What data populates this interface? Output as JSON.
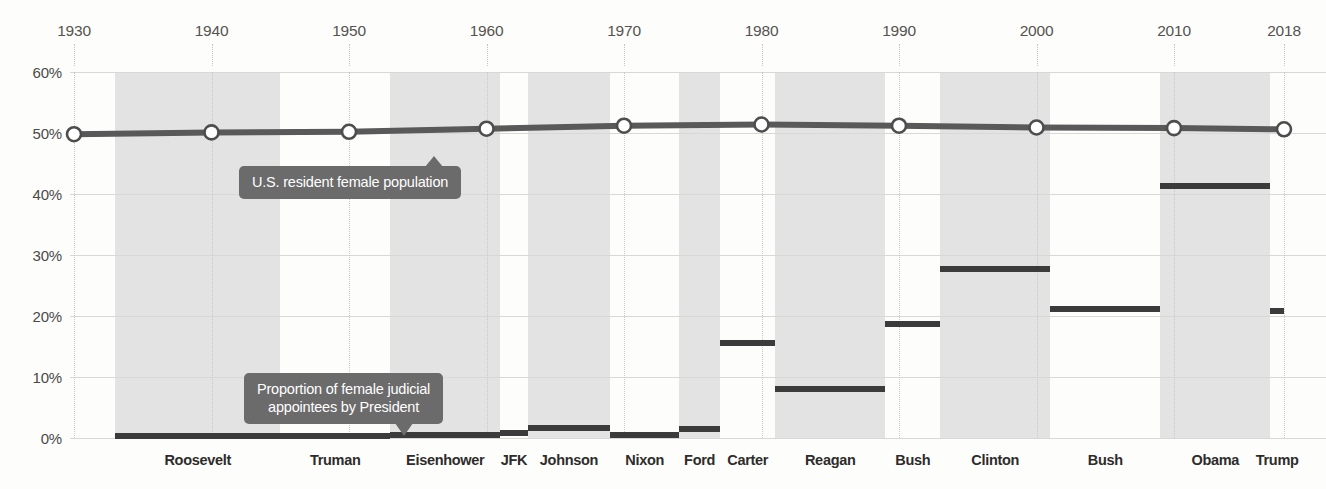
{
  "chart_data": {
    "type": "bar",
    "title": "",
    "subtitle": "",
    "xlabel": "",
    "ylabel": "",
    "ylim": [
      0,
      60
    ],
    "y_ticks": [
      "0%",
      "10%",
      "20%",
      "30%",
      "40%",
      "50%",
      "60%"
    ],
    "y_tick_values": [
      0,
      10,
      20,
      30,
      40,
      50,
      60
    ],
    "x_ticks": [
      "1930",
      "1940",
      "1950",
      "1960",
      "1970",
      "1980",
      "1990",
      "2000",
      "2010",
      "2018"
    ],
    "x_tick_values": [
      1930,
      1940,
      1950,
      1960,
      1970,
      1980,
      1990,
      2000,
      2010,
      2018
    ],
    "grid": true,
    "legend_position": "annotations",
    "categories": [
      "Roosevelt",
      "Truman",
      "Eisenhower",
      "JFK",
      "Johnson",
      "Nixon",
      "Ford",
      "Carter",
      "Reagan",
      "Bush",
      "Clinton",
      "Bush",
      "Obama",
      "Trump"
    ],
    "series": [
      {
        "name": "Proportion of female judicial appointees by President",
        "type": "step",
        "color": "#3b3b3b",
        "values": [
          0.4,
          0.4,
          0.5,
          0.8,
          1.7,
          0.5,
          1.5,
          15.5,
          8.0,
          18.7,
          27.7,
          21.2,
          41.3,
          20.8
        ],
        "terms": [
          {
            "president": "Roosevelt",
            "start": 1933,
            "end": 1945,
            "value": 0.4
          },
          {
            "president": "Truman",
            "start": 1945,
            "end": 1953,
            "value": 0.4
          },
          {
            "president": "Eisenhower",
            "start": 1953,
            "end": 1961,
            "value": 0.5
          },
          {
            "president": "JFK",
            "start": 1961,
            "end": 1963,
            "value": 0.8
          },
          {
            "president": "Johnson",
            "start": 1963,
            "end": 1969,
            "value": 1.7
          },
          {
            "president": "Nixon",
            "start": 1969,
            "end": 1974,
            "value": 0.5
          },
          {
            "president": "Ford",
            "start": 1974,
            "end": 1977,
            "value": 1.5
          },
          {
            "president": "Carter",
            "start": 1977,
            "end": 1981,
            "value": 15.5
          },
          {
            "president": "Reagan",
            "start": 1981,
            "end": 1989,
            "value": 8.0
          },
          {
            "president": "Bush",
            "start": 1989,
            "end": 1993,
            "value": 18.7
          },
          {
            "president": "Clinton",
            "start": 1993,
            "end": 2001,
            "value": 27.7
          },
          {
            "president": "Bush",
            "start": 2001,
            "end": 2009,
            "value": 21.2
          },
          {
            "president": "Obama",
            "start": 2009,
            "end": 2017,
            "value": 41.3
          },
          {
            "president": "Trump",
            "start": 2017,
            "end": 2018,
            "value": 20.8
          }
        ]
      },
      {
        "name": "U.S. resident female population",
        "type": "line",
        "color": "#595959",
        "marker": "circle-open",
        "x": [
          1930,
          1940,
          1950,
          1960,
          1970,
          1980,
          1990,
          2000,
          2010,
          2018
        ],
        "values": [
          49.8,
          50.1,
          50.2,
          50.7,
          51.2,
          51.4,
          51.2,
          50.9,
          50.8,
          50.6
        ]
      }
    ],
    "annotations": [
      {
        "id": "population-callout",
        "text": "U.S. resident female population",
        "lines": [
          "U.S. resident female population"
        ],
        "pointer": "up"
      },
      {
        "id": "appointees-callout",
        "text": "Proportion of female judicial appointees by President",
        "lines": [
          "Proportion of female judicial",
          "appointees by President"
        ],
        "pointer": "down"
      }
    ],
    "colors": {
      "bar": "#3b3b3b",
      "line": "#595959",
      "band": "#e3e3e3",
      "callout_bg": "#6b6b6b",
      "grid": "#d8d8d6",
      "background": "#fdfdfc"
    }
  }
}
